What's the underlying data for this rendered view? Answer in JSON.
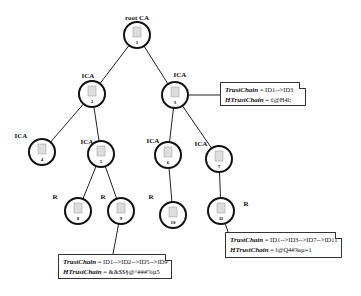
{
  "diagram": {
    "nodes": [
      {
        "id": "1",
        "role": "root CA",
        "x": 137,
        "y": 35
      },
      {
        "id": "2",
        "role": "ICA",
        "x": 92,
        "y": 94
      },
      {
        "id": "3",
        "role": "ICA",
        "x": 175,
        "y": 95
      },
      {
        "id": "4",
        "role": "ICA",
        "x": 42,
        "y": 152
      },
      {
        "id": "5",
        "role": "ICA",
        "x": 101,
        "y": 154
      },
      {
        "id": "6",
        "role": "ICA",
        "x": 168,
        "y": 155
      },
      {
        "id": "7",
        "role": "ICA",
        "x": 219,
        "y": 159
      },
      {
        "id": "8",
        "role": "R",
        "x": 78,
        "y": 211
      },
      {
        "id": "9",
        "role": "R",
        "x": 121,
        "y": 211
      },
      {
        "id": "10",
        "role": "R",
        "x": 173,
        "y": 215
      },
      {
        "id": "11",
        "role": "R",
        "x": 221,
        "y": 211
      }
    ],
    "edges": [
      [
        "1",
        "2"
      ],
      [
        "1",
        "3"
      ],
      [
        "2",
        "4"
      ],
      [
        "2",
        "5"
      ],
      [
        "5",
        "8"
      ],
      [
        "5",
        "9"
      ],
      [
        "3",
        "6"
      ],
      [
        "3",
        "7"
      ],
      [
        "6",
        "10"
      ],
      [
        "7",
        "11"
      ]
    ],
    "labels": {
      "n1": "root CA",
      "n2": "ICA",
      "n3": "ICA",
      "n4": "ICA",
      "n5": "ICA",
      "n6": "ICA",
      "n7": "ICA",
      "n8": "R",
      "n9": "R",
      "n10": "R",
      "n11": "R"
    },
    "callouts": [
      {
        "attached_to": "3",
        "trust_key": "TrustChain",
        "trust_val": " = ID1-->ID3",
        "htrust_key": "HTrustChain",
        "htrust_val": " = ¢@H4l;"
      },
      {
        "attached_to": "9",
        "trust_key": "TrustChain",
        "trust_val": " = ID1-->ID2-->ID5-->ID9",
        "htrust_key": "HTrustChain",
        "htrust_val": " = &&$$§@^###%µ5"
      },
      {
        "attached_to": "11",
        "trust_key": "TrustChain",
        "trust_val": " = ID1-->ID3-->ID7-->ID11",
        "htrust_key": "HTrustChain",
        "htrust_val": " = ‖@Q4#‰µ=1"
      }
    ]
  }
}
